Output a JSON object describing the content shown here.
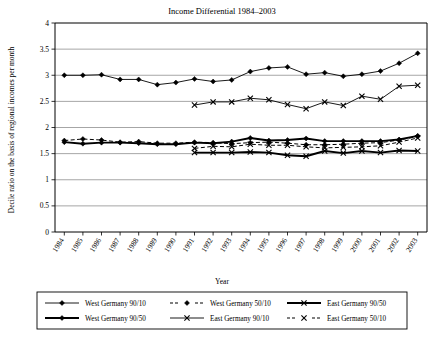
{
  "chart_data": {
    "type": "line",
    "title": "Income Differential 1984–2003",
    "xlabel": "Year",
    "ylabel": "Decile ratio on the basis of regional incomes per month",
    "grid": true,
    "legend_position": "bottom",
    "xlim": [
      1984,
      2003
    ],
    "ylim": [
      0,
      4
    ],
    "yticks": [
      "0",
      "0.5",
      "1",
      "1.5",
      "2",
      "2.5",
      "3",
      "3.5",
      "4"
    ],
    "ytick_values": [
      0,
      0.5,
      1,
      1.5,
      2,
      2.5,
      3,
      3.5,
      4
    ],
    "categories": [
      "1984",
      "1985",
      "1986",
      "1987",
      "1988",
      "1989",
      "1990",
      "1991",
      "1992",
      "1993",
      "1994",
      "1995",
      "1996",
      "1997",
      "1998",
      "1999",
      "2000",
      "2001",
      "2002",
      "2003"
    ],
    "series": [
      {
        "name": "West Germany 90/10",
        "marker": "diamond",
        "line": "thin-solid",
        "values": [
          3.0,
          3.0,
          3.01,
          2.92,
          2.92,
          2.82,
          2.86,
          2.93,
          2.88,
          2.91,
          3.07,
          3.14,
          3.16,
          3.02,
          3.05,
          2.98,
          3.02,
          3.08,
          3.23,
          3.42
        ]
      },
      {
        "name": "West Germany 90/50",
        "marker": "diamond",
        "line": "thick-solid",
        "values": [
          1.72,
          1.69,
          1.71,
          1.71,
          1.7,
          1.68,
          1.68,
          1.71,
          1.7,
          1.73,
          1.8,
          1.75,
          1.76,
          1.79,
          1.74,
          1.74,
          1.74,
          1.74,
          1.77,
          1.84
        ]
      },
      {
        "name": "West Germany 50/10",
        "marker": "diamond",
        "line": "dashed",
        "values": [
          1.75,
          1.78,
          1.76,
          1.72,
          1.73,
          1.7,
          1.7,
          1.72,
          1.71,
          1.69,
          1.71,
          1.72,
          1.7,
          1.67,
          1.67,
          1.68,
          1.7,
          1.71,
          1.76,
          1.83
        ]
      },
      {
        "name": "East Germany 90/10",
        "marker": "x",
        "line": "thin-solid",
        "values": [
          null,
          null,
          null,
          null,
          null,
          null,
          null,
          2.43,
          2.49,
          2.49,
          2.56,
          2.53,
          2.44,
          2.36,
          2.49,
          2.42,
          2.6,
          2.54,
          2.79,
          2.81
        ]
      },
      {
        "name": "East Germany 90/50",
        "marker": "x",
        "line": "thick-solid",
        "values": [
          null,
          null,
          null,
          null,
          null,
          null,
          null,
          1.52,
          1.52,
          1.52,
          1.53,
          1.52,
          1.47,
          1.45,
          1.55,
          1.51,
          1.55,
          1.52,
          1.56,
          1.55
        ]
      },
      {
        "name": "East Germany 50/10",
        "marker": "x",
        "line": "dashed",
        "values": [
          null,
          null,
          null,
          null,
          null,
          null,
          null,
          1.6,
          1.64,
          1.63,
          1.68,
          1.66,
          1.66,
          1.63,
          1.61,
          1.62,
          1.63,
          1.65,
          1.72,
          1.8
        ]
      }
    ]
  },
  "legend": {
    "entries": [
      {
        "label": "West Germany 90/10",
        "style": "thin-solid",
        "marker": "diamond"
      },
      {
        "label": "West Germany 90/50",
        "style": "thick-solid",
        "marker": "diamond"
      },
      {
        "label": "West Germany 50/10",
        "style": "dashed",
        "marker": "diamond"
      },
      {
        "label": "East Germany 90/10",
        "style": "thin-solid",
        "marker": "x"
      },
      {
        "label": "East Germany 90/50",
        "style": "thick-solid",
        "marker": "x"
      },
      {
        "label": "East Germany 50/10",
        "style": "dashed",
        "marker": "x"
      }
    ]
  },
  "colors": {
    "ink": "#000000",
    "grid": "#808080",
    "background": "#ffffff"
  }
}
